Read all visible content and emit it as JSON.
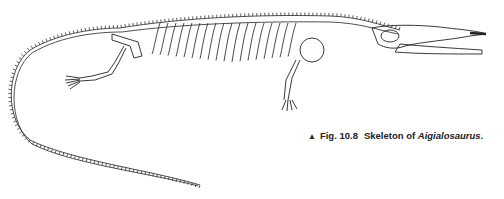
{
  "figure": {
    "illustration_alt": "Line drawing of the skeleton of Aigialosaurus",
    "caption": {
      "marker": "▲",
      "label": "Fig. 10.8",
      "text": "Skeleton of ",
      "genus": "Aigialosaurus",
      "end": "."
    }
  }
}
